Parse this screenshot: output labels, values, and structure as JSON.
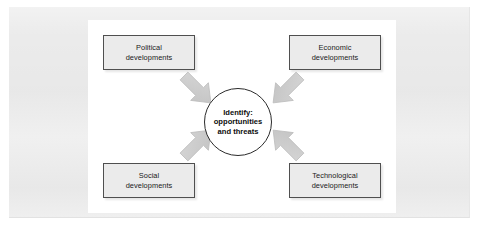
{
  "diagram": {
    "type": "convergent-influences",
    "title_text": "",
    "colors": {
      "page_background": "#ffffff",
      "outer_frame": "#ebebeb",
      "panel_background": "#ffffff",
      "box_fill": "#ebebeb",
      "box_border": "#4f4f4f",
      "circle_fill": "#ffffff",
      "circle_border": "#2b2b2b",
      "arrow_fill": "#c9c9c9",
      "arrow_border": "#b0b0b0",
      "text": "#1a1a1a"
    },
    "center": {
      "name": "center-node",
      "lines": [
        "Identify:",
        "opportunities",
        "and threats"
      ],
      "line1": "Identify:",
      "line2": "opportunities",
      "line3": "and threats"
    },
    "nodes": [
      {
        "id": "political",
        "position": "top-left",
        "lines": [
          "Political",
          "developments"
        ],
        "line1": "Political",
        "line2": "developments",
        "arrow": {
          "name": "arrow-political-to-center",
          "direction": "down-right"
        }
      },
      {
        "id": "economic",
        "position": "top-right",
        "lines": [
          "Economic",
          "developments"
        ],
        "line1": "Economic",
        "line2": "developments",
        "arrow": {
          "name": "arrow-economic-to-center",
          "direction": "down-left"
        }
      },
      {
        "id": "social",
        "position": "bottom-left",
        "lines": [
          "Social",
          "developments"
        ],
        "line1": "Social",
        "line2": "developments",
        "arrow": {
          "name": "arrow-social-to-center",
          "direction": "up-right"
        }
      },
      {
        "id": "technological",
        "position": "bottom-right",
        "lines": [
          "Technological",
          "developments"
        ],
        "line1": "Technological",
        "line2": "developments",
        "arrow": {
          "name": "arrow-technological-to-center",
          "direction": "up-left"
        }
      }
    ]
  }
}
